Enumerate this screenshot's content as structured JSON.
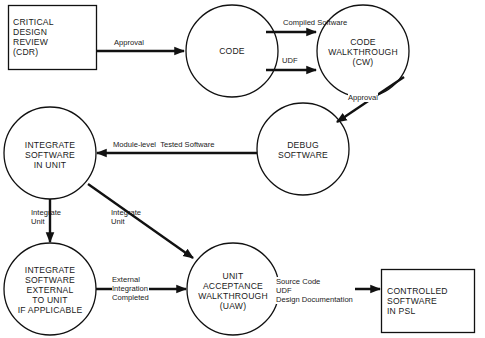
{
  "diagram": {
    "nodes": [
      {
        "id": "cdr",
        "shape": "box",
        "label": "CRITICAL\nDESIGN\nREVIEW\n(CDR)"
      },
      {
        "id": "code",
        "shape": "circle",
        "label": "CODE"
      },
      {
        "id": "cw",
        "shape": "circle",
        "label": "CODE\nWALKTHROUGH\n(CW)"
      },
      {
        "id": "debug",
        "shape": "circle",
        "label": "DEBUG\nSOFTWARE"
      },
      {
        "id": "integrate_unit",
        "shape": "circle",
        "label": "INTEGRATE\nSOFTWARE\nIN UNIT"
      },
      {
        "id": "integrate_external",
        "shape": "circle",
        "label": "INTEGRATE\nSOFTWARE\nEXTERNAL\nTO UNIT\nIF APPLICABLE"
      },
      {
        "id": "uaw",
        "shape": "circle",
        "label": "UNIT\nACCEPTANCE\nWALKTHROUGH\n(UAW)"
      },
      {
        "id": "controlled",
        "shape": "box",
        "label": "CONTROLLED\nSOFTWARE\nIN PSL"
      }
    ],
    "edges": [
      {
        "from": "cdr",
        "to": "code",
        "label": "Approval"
      },
      {
        "from": "code",
        "to": "cw",
        "label": "Compiled Software"
      },
      {
        "from": "code",
        "to": "cw",
        "label": "UDF"
      },
      {
        "from": "cw",
        "to": "debug",
        "label": "Approval"
      },
      {
        "from": "debug",
        "to": "integrate_unit",
        "label": "Module-level  Tested Software"
      },
      {
        "from": "integrate_unit",
        "to": "integrate_external",
        "label": "Integrate\nUnit"
      },
      {
        "from": "integrate_unit",
        "to": "uaw",
        "label": "Integrate\nUnit"
      },
      {
        "from": "integrate_external",
        "to": "uaw",
        "label": "External\nIntegration\nCompleted"
      },
      {
        "from": "uaw",
        "to": "controlled",
        "label": "Source Code\nUDF\nDesign Documentation"
      }
    ]
  },
  "colors": {
    "stroke": "#111111",
    "background": "#ffffff"
  }
}
